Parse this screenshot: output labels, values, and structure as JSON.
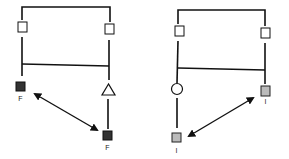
{
  "colors": {
    "line": "#111111",
    "affected_fill": "#333333",
    "carrier_fill": "#bbbbbb",
    "unaffected_fill": "#ffffff"
  },
  "pedigrees": [
    {
      "id": "left",
      "nodes": [
        {
          "shape": "square",
          "fill": "unaffected",
          "label": ""
        },
        {
          "shape": "square",
          "fill": "unaffected",
          "label": ""
        },
        {
          "shape": "square",
          "fill": "affected",
          "label": "F"
        },
        {
          "shape": "triangle",
          "fill": "unaffected",
          "label": ""
        },
        {
          "shape": "square",
          "fill": "affected",
          "label": "F"
        }
      ],
      "arrow": "double-headed"
    },
    {
      "id": "right",
      "nodes": [
        {
          "shape": "square",
          "fill": "unaffected",
          "label": ""
        },
        {
          "shape": "square",
          "fill": "unaffected",
          "label": ""
        },
        {
          "shape": "circle",
          "fill": "unaffected",
          "label": ""
        },
        {
          "shape": "square",
          "fill": "carrier",
          "label": "I"
        },
        {
          "shape": "square",
          "fill": "carrier",
          "label": "I"
        }
      ],
      "arrow": "double-headed"
    }
  ],
  "labels": {
    "left_bottom_left": "F",
    "left_bottom_right": "F",
    "right_mid_right": "I",
    "right_bottom_left": "I"
  }
}
